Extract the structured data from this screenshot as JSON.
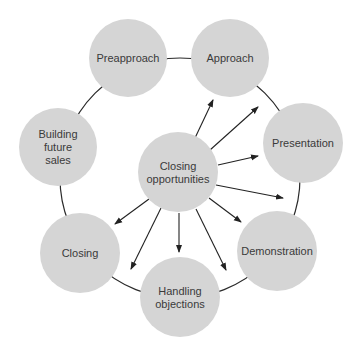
{
  "diagram": {
    "ring": {
      "cx": 180,
      "cy": 178,
      "r": 120
    },
    "center_node": {
      "id": "closing-opportunities",
      "label_lines": [
        "Closing",
        "opportunities"
      ],
      "cx": 178,
      "cy": 172,
      "r": 40
    },
    "nodes": [
      {
        "id": "preapproach",
        "label_lines": [
          "Preapproach"
        ],
        "cx": 128,
        "cy": 58,
        "r": 39
      },
      {
        "id": "approach",
        "label_lines": [
          "Approach"
        ],
        "cx": 230,
        "cy": 58,
        "r": 39
      },
      {
        "id": "presentation",
        "label_lines": [
          "Presentation"
        ],
        "cx": 303,
        "cy": 143,
        "r": 40
      },
      {
        "id": "demonstration",
        "label_lines": [
          "Demonstration"
        ],
        "cx": 277,
        "cy": 251,
        "r": 40
      },
      {
        "id": "handling-objections",
        "label_lines": [
          "Handling",
          "objections"
        ],
        "cx": 180,
        "cy": 297,
        "r": 40
      },
      {
        "id": "closing",
        "label_lines": [
          "Closing"
        ],
        "cx": 80,
        "cy": 253,
        "r": 40
      },
      {
        "id": "building-future-sales",
        "label_lines": [
          "Building",
          "future",
          "sales"
        ],
        "cx": 58,
        "cy": 147,
        "r": 39
      }
    ],
    "arrows": [
      {
        "x1": 195,
        "y1": 138,
        "x2": 213,
        "y2": 100
      },
      {
        "x1": 210,
        "y1": 150,
        "x2": 258,
        "y2": 107
      },
      {
        "x1": 218,
        "y1": 165,
        "x2": 258,
        "y2": 156
      },
      {
        "x1": 216,
        "y1": 185,
        "x2": 283,
        "y2": 198
      },
      {
        "x1": 209,
        "y1": 198,
        "x2": 241,
        "y2": 222
      },
      {
        "x1": 196,
        "y1": 209,
        "x2": 226,
        "y2": 270
      },
      {
        "x1": 179,
        "y1": 213,
        "x2": 179,
        "y2": 252
      },
      {
        "x1": 161,
        "y1": 208,
        "x2": 131,
        "y2": 269
      },
      {
        "x1": 149,
        "y1": 199,
        "x2": 115,
        "y2": 224
      }
    ],
    "colors": {
      "node_fill": "#d5d5d5",
      "line": "#222222",
      "text": "#3a3a3a"
    }
  }
}
